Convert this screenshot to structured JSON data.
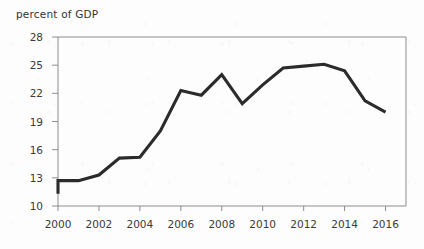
{
  "chart_data": {
    "type": "line",
    "title": "percent of GDP",
    "xlabel": "",
    "ylabel": "percent of GDP",
    "x": [
      2000,
      2000,
      2001,
      2002,
      2003,
      2004,
      2005,
      2006,
      2007,
      2008,
      2009,
      2010,
      2011,
      2012,
      2013,
      2014,
      2015,
      2016
    ],
    "values": [
      11.3,
      12.7,
      12.7,
      13.3,
      15.1,
      15.2,
      18.0,
      22.3,
      21.8,
      24.0,
      20.9,
      22.9,
      24.7,
      24.9,
      25.1,
      24.4,
      21.2,
      20.0
    ],
    "xlim": [
      2000,
      2017
    ],
    "ylim": [
      10,
      28
    ],
    "xticks": [
      2000,
      2002,
      2004,
      2006,
      2008,
      2010,
      2012,
      2014,
      2016
    ],
    "xtick_labels": [
      "2000",
      "2002",
      "2004",
      "2006",
      "2008",
      "2010",
      "2012",
      "2014",
      "2016"
    ],
    "yticks": [
      10,
      13,
      16,
      19,
      22,
      25,
      28
    ],
    "ytick_labels": [
      "10",
      "13",
      "16",
      "19",
      "22",
      "25",
      "28"
    ],
    "grid": false,
    "legend": null,
    "series": [
      {
        "name": "percent of GDP",
        "color": "#2b2b2b",
        "values": [
          11.3,
          12.7,
          12.7,
          13.3,
          15.1,
          15.2,
          18.0,
          22.3,
          21.8,
          24.0,
          20.9,
          22.9,
          24.7,
          24.9,
          25.1,
          24.4,
          21.2,
          20.0
        ]
      }
    ]
  },
  "colors": {
    "line": "#2b2b2b",
    "axis": "#8d8d8d",
    "text": "#3a3a3a",
    "background": "#fdfdfd"
  }
}
